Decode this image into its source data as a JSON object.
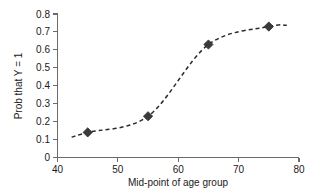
{
  "chart_data": {
    "type": "line",
    "title": "",
    "subtitle": "",
    "xlabel": "Mid-point of age group",
    "ylabel": "Prob that Y = 1",
    "x": [
      45,
      55,
      65,
      75
    ],
    "values": [
      0.14,
      0.23,
      0.63,
      0.73
    ],
    "series": [
      {
        "name": "Prob that Y = 1",
        "x": [
          45,
          55,
          65,
          75
        ],
        "values": [
          0.14,
          0.23,
          0.63,
          0.73
        ],
        "line_style": "dashed",
        "marker": "diamond",
        "color": "#3a3a3a"
      }
    ],
    "xlim": [
      40,
      80
    ],
    "ylim": [
      0,
      0.8
    ],
    "xticks": [
      40,
      50,
      60,
      70,
      80
    ],
    "xtick_labels": [
      "40",
      "50",
      "60",
      "70",
      "80"
    ],
    "yticks": [
      0,
      0.1,
      0.2,
      0.3,
      0.4,
      0.5,
      0.6,
      0.7,
      0.8
    ],
    "ytick_labels": [
      "0",
      "0.1",
      "0.2",
      "0.3",
      "0.4",
      "0.5",
      "0.6",
      "0.7",
      "0.8"
    ],
    "grid": false,
    "legend": false,
    "legend_position": "none",
    "annotations": [],
    "smooth": true,
    "line_extends_beyond_last_point": true,
    "axis_color": "#6b6b6b",
    "marker_color": "#3a3a3a",
    "background_color": "#ffffff"
  }
}
